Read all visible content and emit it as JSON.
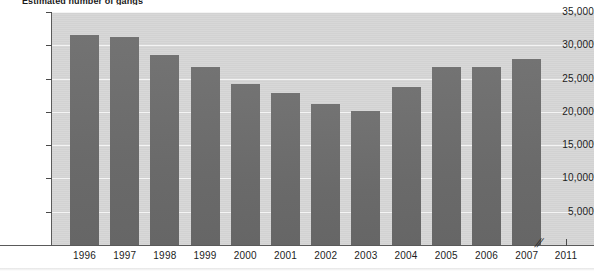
{
  "chart_data": {
    "type": "bar",
    "title": "Estimated number of gangs",
    "xlabel": "",
    "ylabel": "",
    "categories": [
      "1996",
      "1997",
      "1998",
      "1999",
      "2000",
      "2001",
      "2002",
      "2003",
      "2004",
      "2005",
      "2006",
      "2007",
      "2011"
    ],
    "values": [
      31500,
      31200,
      28500,
      26800,
      24200,
      22900,
      21200,
      20100,
      23800,
      26700,
      26700,
      27900,
      null
    ],
    "ylim": [
      0,
      35000
    ],
    "ytick_labels": [
      "35,000",
      "30,000",
      "25,000",
      "20,000",
      "15,000",
      "10,000",
      "5,000"
    ],
    "ytick_values": [
      35000,
      30000,
      25000,
      20000,
      15000,
      10000,
      5000
    ],
    "grid": true,
    "legend": null,
    "axis_break": {
      "symbol": "//",
      "between": [
        "2007",
        "2011"
      ],
      "note": "x-axis break between 2007 and 2011"
    },
    "colors": {
      "bar": "#6d6d6d",
      "plot_background": "#d6d6d6",
      "gridline": "#f4f4f4",
      "axis": "#5a5a5a",
      "text": "#1c1c1c"
    }
  }
}
